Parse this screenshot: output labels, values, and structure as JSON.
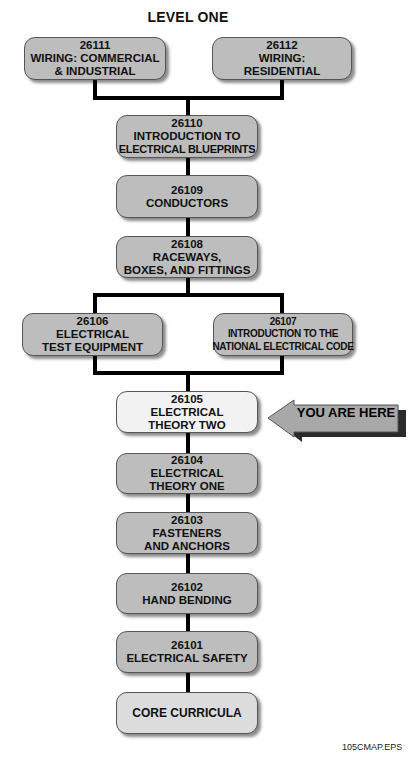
{
  "diagram": {
    "title": "LEVEL ONE",
    "caption": "105CMAP.EPS",
    "pointer_label": "YOU ARE HERE",
    "colors": {
      "module_fill": "#bdbdbd",
      "current_fill": "#f2f2f2",
      "core_fill": "#dcdcdc",
      "connector": "#000000",
      "arrow_fill": "#a8a8a8"
    },
    "modules": {
      "m26111": {
        "code": "26111",
        "line1": "WIRING: COMMERCIAL",
        "line2": "& INDUSTRIAL"
      },
      "m26112": {
        "code": "26112",
        "line1": "WIRING:",
        "line2": "RESIDENTIAL"
      },
      "m26110": {
        "code": "26110",
        "line1": "INTRODUCTION TO",
        "line2": "ELECTRICAL BLUEPRINTS"
      },
      "m26109": {
        "code": "26109",
        "line1": "CONDUCTORS"
      },
      "m26108": {
        "code": "26108",
        "line1": "RACEWAYS,",
        "line2": "BOXES, AND FITTINGS"
      },
      "m26106": {
        "code": "26106",
        "line1": "ELECTRICAL",
        "line2": "TEST EQUIPMENT"
      },
      "m26107": {
        "code": "26107",
        "line1": "INTRODUCTION TO THE",
        "line2": "NATIONAL ELECTRICAL CODE"
      },
      "m26105": {
        "code": "26105",
        "line1": "ELECTRICAL",
        "line2": "THEORY TWO",
        "current": true
      },
      "m26104": {
        "code": "26104",
        "line1": "ELECTRICAL",
        "line2": "THEORY ONE"
      },
      "m26103": {
        "code": "26103",
        "line1": "FASTENERS",
        "line2": "AND ANCHORS"
      },
      "m26102": {
        "code": "26102",
        "line1": "HAND BENDING"
      },
      "m26101": {
        "code": "26101",
        "line1": "ELECTRICAL SAFETY"
      },
      "core": {
        "line1": "CORE CURRICULA"
      }
    }
  }
}
